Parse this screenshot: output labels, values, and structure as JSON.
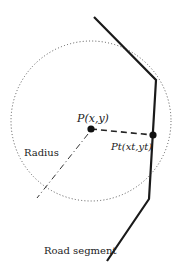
{
  "diagram": {
    "labels": {
      "point": "P(x,y)",
      "projected_point": "Pt(xt,yt)",
      "radius": "Radius",
      "road": "Road segment"
    },
    "colors": {
      "road": "#1a1a1a",
      "circle": "#555555",
      "connector": "#222222",
      "background": "#ffffff"
    },
    "geometry": {
      "circle": {
        "cx": 91,
        "cy": 129,
        "r": 80,
        "style": "dotted"
      },
      "point_P": {
        "x": 91,
        "y": 129
      },
      "point_Pt": {
        "x": 153,
        "y": 135
      },
      "road_polyline": [
        [
          94,
          17
        ],
        [
          156,
          80
        ],
        [
          149,
          199
        ],
        [
          107,
          261
        ]
      ],
      "radius_line": {
        "from": [
          91,
          129
        ],
        "to": [
          37,
          198
        ],
        "style": "dash-dot"
      },
      "perpendicular_line": {
        "from": [
          91,
          129
        ],
        "to": [
          153,
          135
        ],
        "style": "dashed"
      }
    }
  }
}
